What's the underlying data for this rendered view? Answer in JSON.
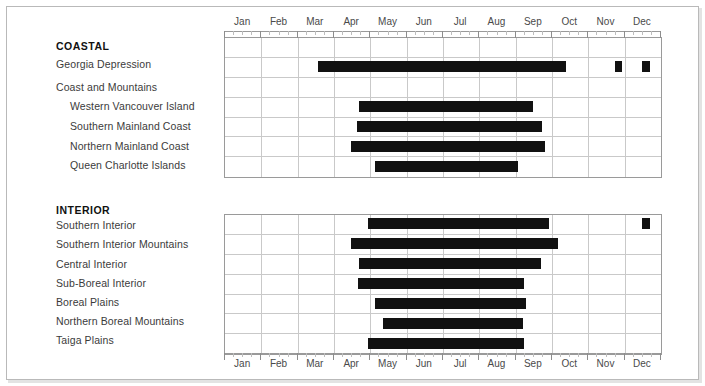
{
  "axis": {
    "months": [
      "Jan",
      "Feb",
      "Mar",
      "Apr",
      "May",
      "Jun",
      "Jul",
      "Aug",
      "Sep",
      "Oct",
      "Nov",
      "Dec"
    ],
    "top_label_row": [
      "Jan",
      "Feb",
      "Mar",
      "Apr",
      "May",
      "Jun",
      "Jul",
      "Aug",
      "Sep",
      "Oct",
      "Nov",
      "Dec"
    ],
    "bottom_label_row": [
      "Jan",
      "Feb",
      "Mar",
      "Apr",
      "May",
      "Jun",
      "Jul",
      "Aug",
      "Sep",
      "Oct",
      "Nov",
      "Dec"
    ]
  },
  "groups": [
    {
      "title": "COASTAL",
      "rows": [
        {
          "label": "Georgia Depression",
          "indent": false
        },
        {
          "label": "Coast and Mountains",
          "indent": false
        },
        {
          "label": "Western Vancouver Island",
          "indent": true
        },
        {
          "label": "Southern Mainland Coast",
          "indent": true
        },
        {
          "label": "Northern Mainland Coast",
          "indent": true
        },
        {
          "label": "Queen Charlotte Islands",
          "indent": true
        }
      ]
    },
    {
      "title": "INTERIOR",
      "rows": [
        {
          "label": "Southern Interior",
          "indent": false
        },
        {
          "label": "Southern Interior Mountains",
          "indent": false
        },
        {
          "label": "Central Interior",
          "indent": false
        },
        {
          "label": "Sub-Boreal Interior",
          "indent": false
        },
        {
          "label": "Boreal Plains",
          "indent": false
        },
        {
          "label": "Northern Boreal Mountains",
          "indent": false
        },
        {
          "label": "Taiga Plains",
          "indent": false
        }
      ]
    }
  ],
  "chart_data": {
    "type": "bar",
    "title": "",
    "xlabel": "",
    "ylabel": "",
    "orientation": "horizontal-gantt",
    "x_axis": {
      "type": "month-of-year",
      "ticks": [
        "Jan",
        "Feb",
        "Mar",
        "Apr",
        "May",
        "Jun",
        "Jul",
        "Aug",
        "Sep",
        "Oct",
        "Nov",
        "Dec"
      ],
      "range_months": [
        1,
        13
      ],
      "minor_ticks_per_month": 4,
      "grid": true
    },
    "legend": null,
    "bar_color": "#111111",
    "series": [
      {
        "name": "Georgia Depression",
        "group": "COASTAL",
        "intervals": [
          {
            "start_month": 3.58,
            "end_month": 10.4,
            "start_label": "mid-Mar",
            "end_label": "early Oct"
          },
          {
            "start_month": 11.76,
            "end_month": 11.96,
            "start_label": "late Nov",
            "end_label": "late Nov"
          },
          {
            "start_month": 12.5,
            "end_month": 12.72,
            "start_label": "mid-Dec",
            "end_label": "mid-Dec"
          }
        ]
      },
      {
        "name": "Coast and Mountains",
        "group": "COASTAL",
        "intervals": []
      },
      {
        "name": "Western Vancouver Island",
        "group": "COASTAL",
        "intervals": [
          {
            "start_month": 4.72,
            "end_month": 9.51,
            "start_label": "late Apr",
            "end_label": "mid-Sep"
          }
        ]
      },
      {
        "name": "Southern Mainland Coast",
        "group": "COASTAL",
        "intervals": [
          {
            "start_month": 4.66,
            "end_month": 9.76,
            "start_label": "late Apr",
            "end_label": "late Sep"
          }
        ]
      },
      {
        "name": "Northern Mainland Coast",
        "group": "COASTAL",
        "intervals": [
          {
            "start_month": 4.5,
            "end_month": 9.84,
            "start_label": "mid-Apr",
            "end_label": "late Sep"
          }
        ]
      },
      {
        "name": "Queen Charlotte Islands",
        "group": "COASTAL",
        "intervals": [
          {
            "start_month": 5.16,
            "end_month": 9.1,
            "start_label": "early May",
            "end_label": "early Sep"
          }
        ]
      },
      {
        "name": "Southern Interior",
        "group": "INTERIOR",
        "intervals": [
          {
            "start_month": 4.97,
            "end_month": 9.95,
            "start_label": "early May",
            "end_label": "late Sep"
          },
          {
            "start_month": 12.5,
            "end_month": 12.72,
            "start_label": "mid-Dec",
            "end_label": "mid-Dec"
          }
        ]
      },
      {
        "name": "Southern Interior Mountains",
        "group": "INTERIOR",
        "intervals": [
          {
            "start_month": 4.5,
            "end_month": 10.2,
            "start_label": "mid-Apr",
            "end_label": "early Oct"
          }
        ]
      },
      {
        "name": "Central Interior",
        "group": "INTERIOR",
        "intervals": [
          {
            "start_month": 4.72,
            "end_month": 9.73,
            "start_label": "late Apr",
            "end_label": "late Sep"
          }
        ]
      },
      {
        "name": "Sub-Boreal Interior",
        "group": "INTERIOR",
        "intervals": [
          {
            "start_month": 4.69,
            "end_month": 9.27,
            "start_label": "late Apr",
            "end_label": "mid-Sep"
          }
        ]
      },
      {
        "name": "Boreal Plains",
        "group": "INTERIOR",
        "intervals": [
          {
            "start_month": 5.16,
            "end_month": 9.3,
            "start_label": "early May",
            "end_label": "mid-Sep"
          }
        ]
      },
      {
        "name": "Northern Boreal Mountains",
        "group": "INTERIOR",
        "intervals": [
          {
            "start_month": 5.38,
            "end_month": 9.22,
            "start_label": "mid-May",
            "end_label": "mid-Sep"
          }
        ]
      },
      {
        "name": "Taiga Plains",
        "group": "INTERIOR",
        "intervals": [
          {
            "start_month": 4.97,
            "end_month": 9.25,
            "start_label": "early May",
            "end_label": "mid-Sep"
          }
        ]
      }
    ]
  }
}
